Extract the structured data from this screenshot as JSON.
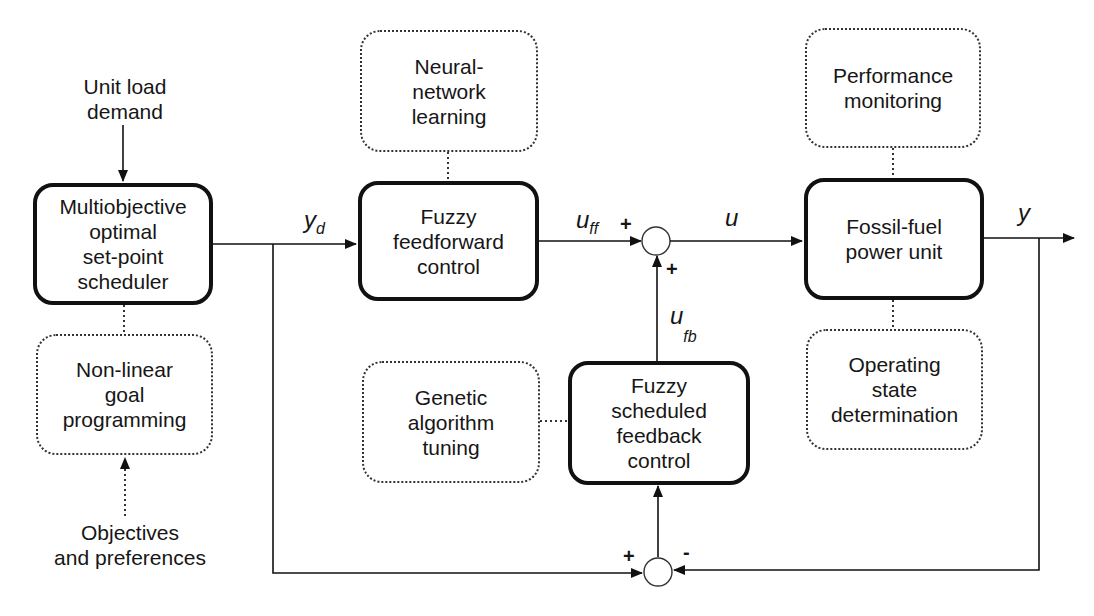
{
  "diagram": {
    "type": "control-block-diagram",
    "inputs": {
      "unit_load_demand": [
        "Unit load",
        "demand"
      ],
      "objectives": [
        "Objectives",
        "and preferences"
      ]
    },
    "blocks": {
      "scheduler": [
        "Multiobjective",
        "optimal",
        "set-point",
        "scheduler"
      ],
      "nonlinear": [
        "Non-linear",
        "goal",
        "programming"
      ],
      "neural": [
        "Neural-",
        "network",
        "learning"
      ],
      "feedforward": [
        "Fuzzy",
        "feedforward",
        "control"
      ],
      "genetic": [
        "Genetic",
        "algorithm",
        "tuning"
      ],
      "feedback": [
        "Fuzzy",
        "scheduled",
        "feedback",
        "control"
      ],
      "plant": [
        "Fossil-fuel",
        "power unit"
      ],
      "performance": [
        "Performance",
        "monitoring"
      ],
      "operating": [
        "Operating",
        "state",
        "determination"
      ]
    },
    "signals": {
      "yd": {
        "main": "y",
        "sub": "d"
      },
      "uff": {
        "main": "u",
        "sub": "ff"
      },
      "u": {
        "main": "u"
      },
      "ufb": {
        "main": "u",
        "sub": "fb"
      },
      "y": {
        "main": "y"
      }
    },
    "signs": {
      "sum1_left": "+",
      "sum1_bottom": "+",
      "sum2_left": "+",
      "sum2_right": "-"
    },
    "colors": {
      "line": "#111111",
      "background": "#ffffff"
    }
  }
}
